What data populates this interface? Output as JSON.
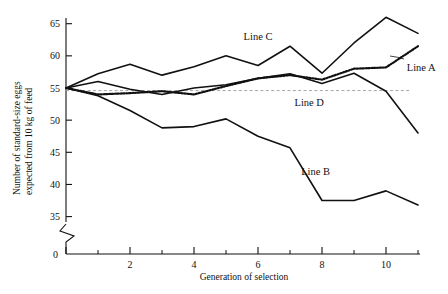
{
  "chart_data": {
    "type": "line",
    "title": "",
    "xlabel": "Generation of selection",
    "ylabel": "Number of standard-size eggs expected from 10 kg of feed",
    "ylabel_line1": "Number of standard-size eggs",
    "ylabel_line2": "expected from 10 kg of feed",
    "x": [
      0,
      1,
      2,
      3,
      4,
      5,
      6,
      7,
      8,
      9,
      10,
      11
    ],
    "xlim": [
      0,
      11.6
    ],
    "ylim": [
      35,
      66.8
    ],
    "yticks": [
      35,
      40,
      45,
      50,
      55,
      60,
      65
    ],
    "ytick_labels": [
      "35",
      "40",
      "45",
      "50",
      "55",
      "60",
      "65"
    ],
    "y_origin_label": "0",
    "axis_break": true,
    "xticks_major": [
      0,
      2,
      4,
      6,
      8,
      10
    ],
    "xtick_labels": [
      "0",
      "2",
      "4",
      "6",
      "8",
      "10"
    ],
    "xticks_minor": [
      1,
      3,
      5,
      7,
      9,
      11
    ],
    "grid": false,
    "reference_line": 54.6,
    "legend": "inline-annotations",
    "series": [
      {
        "name": "Line C",
        "style": "solid",
        "label": "Line C",
        "values": [
          55.0,
          57.2,
          58.7,
          57.0,
          58.3,
          60.0,
          58.5,
          61.5,
          57.3,
          62.0,
          66.0,
          63.5
        ]
      },
      {
        "name": "Line A",
        "style": "dotted",
        "label": "Line A",
        "values": [
          55.0,
          54.0,
          54.2,
          54.5,
          54.0,
          55.3,
          56.5,
          57.0,
          56.3,
          58.0,
          58.2,
          61.5
        ]
      },
      {
        "name": "Line D",
        "style": "solid",
        "label": "Line D",
        "values": [
          55.0,
          56.0,
          54.8,
          54.0,
          55.0,
          55.5,
          56.5,
          57.2,
          55.7,
          57.3,
          54.5,
          48.0
        ]
      },
      {
        "name": "Line B",
        "style": "solid",
        "label": "Line B",
        "values": [
          55.0,
          53.8,
          51.5,
          48.8,
          49.0,
          50.2,
          47.5,
          45.7,
          37.5,
          37.5,
          39.0,
          36.8
        ]
      }
    ],
    "annotations": [
      {
        "text": "Line C",
        "x": 6.0,
        "y": 62.4
      },
      {
        "text": "Line A",
        "x": 11.1,
        "y": 57.6
      },
      {
        "text": "Line D",
        "x": 7.6,
        "y": 52.2
      },
      {
        "text": "Line B",
        "x": 7.8,
        "y": 41.4
      }
    ],
    "colors": {
      "ink": "#111111",
      "reference": "#9b9b9b",
      "background": "#ffffff"
    }
  }
}
